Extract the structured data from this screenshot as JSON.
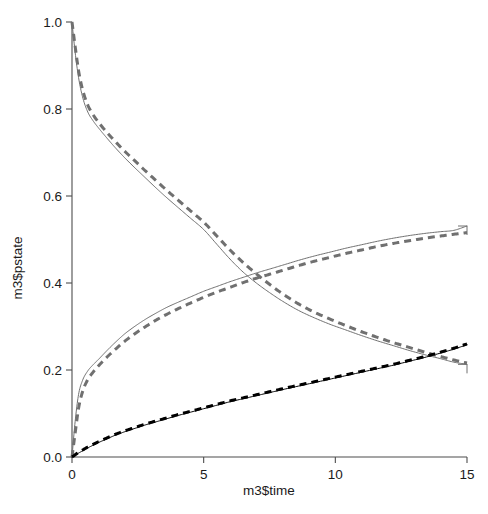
{
  "chart_data": {
    "type": "line",
    "title": "",
    "xlabel": "m3$time",
    "ylabel": "m3$pstate",
    "xlim": [
      0,
      15
    ],
    "ylim": [
      0,
      1
    ],
    "grid": false,
    "legend": "none",
    "xticks": [
      "0",
      "5",
      "10",
      "15"
    ],
    "xtick_values": [
      0,
      5,
      10,
      15
    ],
    "yticks": [
      "0.0",
      "0.2",
      "0.4",
      "0.6",
      "0.8",
      "1.0"
    ],
    "ytick_values": [
      0.0,
      0.2,
      0.4,
      0.6,
      0.8,
      1.0
    ],
    "colors": {
      "state1": "#707070",
      "state2": "#707070",
      "state3": "#000000",
      "axis": "#4d4d4d",
      "background": "#ffffff"
    },
    "series": [
      {
        "name": "state-1-observed",
        "style": "solid",
        "color": "#707070",
        "x": [
          0,
          0.12,
          0.25,
          0.4,
          0.6,
          0.8,
          1.0,
          1.3,
          1.6,
          2.0,
          2.4,
          2.8,
          3.2,
          3.6,
          4.0,
          4.5,
          5.0,
          5.5,
          6.0,
          6.5,
          7.0,
          7.5,
          8.0,
          8.6,
          9.2,
          9.8,
          10.4,
          11.0,
          11.6,
          12.2,
          12.8,
          13.4,
          14.0,
          14.5,
          15.0
        ],
        "y": [
          1.0,
          0.93,
          0.872,
          0.828,
          0.793,
          0.773,
          0.757,
          0.735,
          0.714,
          0.688,
          0.664,
          0.641,
          0.618,
          0.596,
          0.575,
          0.549,
          0.523,
          0.489,
          0.455,
          0.425,
          0.4,
          0.378,
          0.358,
          0.337,
          0.32,
          0.305,
          0.292,
          0.279,
          0.267,
          0.256,
          0.245,
          0.235,
          0.226,
          0.218,
          0.213
        ]
      },
      {
        "name": "state-1-fitted",
        "style": "dashed",
        "color": "#707070",
        "x": [
          0,
          0.12,
          0.25,
          0.4,
          0.6,
          0.8,
          1.0,
          1.3,
          1.6,
          2.0,
          2.4,
          2.8,
          3.2,
          3.6,
          4.0,
          4.5,
          5.0,
          5.5,
          6.0,
          6.5,
          7.0,
          7.5,
          8.0,
          8.6,
          9.2,
          9.8,
          10.4,
          11.0,
          11.6,
          12.2,
          12.8,
          13.4,
          14.0,
          14.5,
          15.0
        ],
        "y": [
          1.0,
          0.944,
          0.888,
          0.845,
          0.809,
          0.787,
          0.77,
          0.748,
          0.728,
          0.703,
          0.68,
          0.657,
          0.635,
          0.613,
          0.592,
          0.566,
          0.54,
          0.508,
          0.476,
          0.447,
          0.421,
          0.397,
          0.375,
          0.352,
          0.333,
          0.317,
          0.302,
          0.288,
          0.275,
          0.263,
          0.252,
          0.241,
          0.231,
          0.223,
          0.216
        ]
      },
      {
        "name": "state-2-observed",
        "style": "solid",
        "color": "#707070",
        "x": [
          0,
          0.12,
          0.25,
          0.4,
          0.6,
          0.8,
          1.0,
          1.3,
          1.6,
          2.0,
          2.4,
          2.8,
          3.2,
          3.6,
          4.0,
          4.5,
          5.0,
          5.5,
          6.0,
          6.5,
          7.0,
          7.5,
          8.0,
          8.6,
          9.2,
          9.8,
          10.4,
          11.0,
          11.6,
          12.2,
          12.8,
          13.4,
          14.0,
          14.5,
          15.0
        ],
        "y": [
          0.0,
          0.082,
          0.144,
          0.176,
          0.198,
          0.212,
          0.224,
          0.243,
          0.261,
          0.283,
          0.301,
          0.317,
          0.331,
          0.344,
          0.355,
          0.368,
          0.381,
          0.392,
          0.403,
          0.413,
          0.423,
          0.432,
          0.441,
          0.452,
          0.462,
          0.471,
          0.48,
          0.488,
          0.496,
          0.503,
          0.509,
          0.514,
          0.518,
          0.521,
          0.531
        ]
      },
      {
        "name": "state-2-fitted",
        "style": "dashed",
        "color": "#707070",
        "x": [
          0,
          0.12,
          0.25,
          0.4,
          0.6,
          0.8,
          1.0,
          1.3,
          1.6,
          2.0,
          2.4,
          2.8,
          3.2,
          3.6,
          4.0,
          4.5,
          5.0,
          5.5,
          6.0,
          6.5,
          7.0,
          7.5,
          8.0,
          8.6,
          9.2,
          9.8,
          10.4,
          11.0,
          11.6,
          12.2,
          12.8,
          13.4,
          14.0,
          14.5,
          15.0
        ],
        "y": [
          0.0,
          0.055,
          0.112,
          0.15,
          0.178,
          0.195,
          0.209,
          0.228,
          0.245,
          0.266,
          0.284,
          0.3,
          0.315,
          0.328,
          0.34,
          0.354,
          0.367,
          0.379,
          0.39,
          0.401,
          0.411,
          0.42,
          0.429,
          0.44,
          0.45,
          0.459,
          0.468,
          0.476,
          0.484,
          0.491,
          0.497,
          0.503,
          0.508,
          0.512,
          0.516
        ]
      },
      {
        "name": "state-3-observed",
        "style": "solid",
        "color": "#000000",
        "x": [
          0,
          0.12,
          0.25,
          0.4,
          0.6,
          0.8,
          1.0,
          1.3,
          1.6,
          2.0,
          2.4,
          2.8,
          3.2,
          3.6,
          4.0,
          4.5,
          5.0,
          5.5,
          6.0,
          6.5,
          7.0,
          7.5,
          8.0,
          8.6,
          9.2,
          9.8,
          10.4,
          11.0,
          11.6,
          12.2,
          12.8,
          13.4,
          14.0,
          14.5,
          15.0
        ],
        "y": [
          0.0,
          0.004,
          0.009,
          0.014,
          0.021,
          0.027,
          0.033,
          0.041,
          0.049,
          0.058,
          0.066,
          0.074,
          0.081,
          0.088,
          0.095,
          0.103,
          0.111,
          0.119,
          0.127,
          0.134,
          0.141,
          0.148,
          0.155,
          0.163,
          0.171,
          0.179,
          0.187,
          0.195,
          0.203,
          0.211,
          0.22,
          0.229,
          0.239,
          0.248,
          0.258
        ]
      },
      {
        "name": "state-3-fitted",
        "style": "dashed",
        "color": "#000000",
        "x": [
          0,
          0.12,
          0.25,
          0.4,
          0.6,
          0.8,
          1.0,
          1.3,
          1.6,
          2.0,
          2.4,
          2.8,
          3.2,
          3.6,
          4.0,
          4.5,
          5.0,
          5.5,
          6.0,
          6.5,
          7.0,
          7.5,
          8.0,
          8.6,
          9.2,
          9.8,
          10.4,
          11.0,
          11.6,
          12.2,
          12.8,
          13.4,
          14.0,
          14.5,
          15.0
        ],
        "y": [
          0.0,
          0.005,
          0.011,
          0.016,
          0.023,
          0.029,
          0.035,
          0.043,
          0.051,
          0.06,
          0.068,
          0.076,
          0.083,
          0.09,
          0.097,
          0.105,
          0.113,
          0.121,
          0.129,
          0.136,
          0.143,
          0.15,
          0.157,
          0.165,
          0.173,
          0.181,
          0.189,
          0.197,
          0.205,
          0.213,
          0.222,
          0.231,
          0.241,
          0.25,
          0.26
        ]
      }
    ],
    "annotations": [
      {
        "name": "state-2-end-step",
        "x": 15,
        "y": 0.531
      },
      {
        "name": "state-1-end-step",
        "x": 15,
        "y": 0.213
      },
      {
        "name": "crossing-state1-state2",
        "x": 6.05,
        "y": 0.44
      },
      {
        "name": "crossing-state1-state3",
        "x": 13.1,
        "y": 0.235
      }
    ]
  },
  "plot_geometry": {
    "x0_px": 72,
    "x1_px": 467,
    "y0_px": 457,
    "y1_px": 22
  }
}
